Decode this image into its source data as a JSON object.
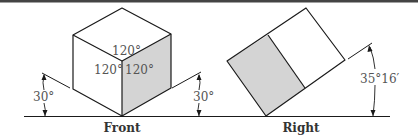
{
  "figure": {
    "colors": {
      "line": "#1a1a1a",
      "shade": "#d4d4d4",
      "angle_text": "#555555",
      "caption_text": "#333333",
      "top_rule": "#444444"
    },
    "front": {
      "caption": "Front",
      "angles": {
        "top": "120°",
        "left": "120°",
        "right": "120°",
        "left_incline": "30°",
        "right_incline": "30°"
      }
    },
    "right": {
      "caption": "Right",
      "angles": {
        "incline": "35°16′"
      }
    }
  }
}
